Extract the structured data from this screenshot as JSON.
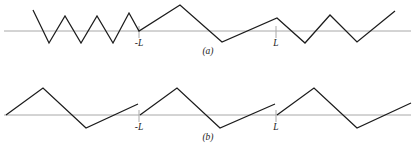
{
  "figure": {
    "title": "",
    "background_color": "#ffffff",
    "line_color": "#1c1c1c",
    "axis_color": "#a8a8a8",
    "panels": [
      {
        "id": "a",
        "label": "(a)",
        "tick_labels": {
          "left": "-L",
          "right": "L"
        }
      },
      {
        "id": "b",
        "label": "(b)",
        "tick_labels": {
          "left": "-L",
          "right": "L"
        }
      }
    ]
  },
  "chart_data": {
    "type": "line",
    "title": "",
    "xlabel": "",
    "ylabel": "",
    "grid": false,
    "legend": null,
    "note": "Two piecewise-linear waveform panels over a horizontal zero axis; panel (a) is the odd/even periodic extension with continuous kinks, panel (b) is the periodic extension with jump discontinuities at x = -L and x = L.",
    "panels": [
      {
        "name": "(a)",
        "baseline_y": 31,
        "axis_x": [
          4,
          411
        ],
        "ticks": [
          {
            "label": "-L",
            "x": 139,
            "y_top": 26,
            "y_bottom": 38,
            "label_x": 139,
            "label_y": 46
          },
          {
            "label": "L",
            "x": 276,
            "y_top": 26,
            "y_bottom": 38,
            "label_x": 276,
            "label_y": 46
          }
        ],
        "panel_label": {
          "text": "(a)",
          "x": 208,
          "y": 54
        },
        "polyline": [
          [
            33,
            10
          ],
          [
            49,
            43
          ],
          [
            65,
            16
          ],
          [
            81,
            43
          ],
          [
            97,
            16
          ],
          [
            113,
            43
          ],
          [
            129,
            13
          ],
          [
            139,
            31
          ],
          [
            180,
            5
          ],
          [
            222,
            42
          ],
          [
            277,
            18
          ],
          [
            305,
            43
          ],
          [
            330,
            15
          ],
          [
            357,
            42
          ],
          [
            395,
            11
          ]
        ]
      },
      {
        "name": "(b)",
        "baseline_y": 115,
        "axis_x": [
          4,
          411
        ],
        "ticks": [
          {
            "label": "-L",
            "x": 139,
            "y_top": 110,
            "y_bottom": 122,
            "label_x": 139,
            "label_y": 130
          },
          {
            "label": "L",
            "x": 276,
            "y_top": 110,
            "y_bottom": 122,
            "label_x": 276,
            "label_y": 130
          }
        ],
        "panel_label": {
          "text": "(b)",
          "x": 208,
          "y": 140
        },
        "segments": [
          [
            [
              6,
              115
            ],
            [
              43,
              88
            ],
            [
              86,
              128
            ],
            [
              138,
              104
            ]
          ],
          [
            [
              140,
              115
            ],
            [
              177,
              88
            ],
            [
              220,
              128
            ],
            [
              275,
              104
            ]
          ],
          [
            [
              277,
              115
            ],
            [
              314,
              88
            ],
            [
              357,
              128
            ],
            [
              411,
              103
            ]
          ]
        ]
      }
    ]
  }
}
